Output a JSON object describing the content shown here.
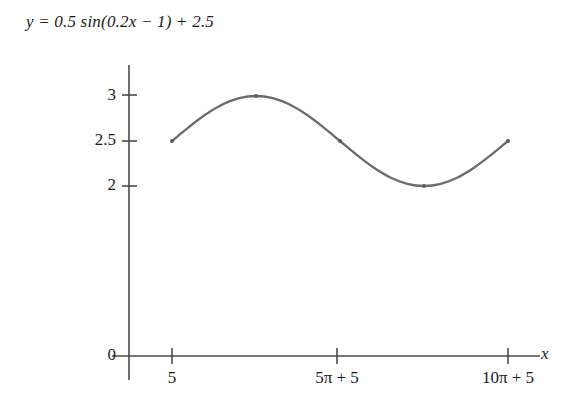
{
  "title": "y = 0.5 sin(0.2x − 1) + 2.5",
  "colors": {
    "curve": "#6b6b6b",
    "axis": "#4a4a4a",
    "text": "#1a1a1a",
    "background": "#ffffff"
  },
  "axes": {
    "x_label": "x",
    "y_label": "",
    "x_tick_labels": [
      "5",
      "5π + 5",
      "10π + 5"
    ],
    "y_tick_labels": [
      "3",
      "2.5",
      "2",
      "0"
    ]
  },
  "chart_data": {
    "type": "line",
    "title": "y = 0.5 sin(0.2x − 1) + 2.5",
    "xlabel": "x",
    "ylabel": "",
    "grid": false,
    "legend": null,
    "function": "y = 0.5 sin(0.2x - 1) + 2.5",
    "amplitude": 0.5,
    "midline": 2.5,
    "period_label": "10π",
    "x_ticks": [
      {
        "label": "5",
        "value": 5
      },
      {
        "label": "5π + 5",
        "value": 20.708
      },
      {
        "label": "10π + 5",
        "value": 36.416
      }
    ],
    "y_ticks": [
      {
        "label": "3",
        "value": 3
      },
      {
        "label": "2.5",
        "value": 2.5
      },
      {
        "label": "2",
        "value": 2
      },
      {
        "label": "0",
        "value": 0
      }
    ],
    "xlim": [
      5,
      36.416
    ],
    "ylim": [
      0,
      3.3
    ],
    "key_points": [
      {
        "label": "start",
        "x": 5,
        "y": 2.5
      },
      {
        "label": "maximum",
        "x": 12.854,
        "y": 3
      },
      {
        "label": "midline-descending",
        "x": 20.708,
        "y": 2.5
      },
      {
        "label": "minimum",
        "x": 28.562,
        "y": 2
      },
      {
        "label": "end",
        "x": 36.416,
        "y": 2.5
      }
    ],
    "series": [
      {
        "name": "y = 0.5 sin(0.2x - 1) + 2.5",
        "x": [
          5,
          6.571,
          8.142,
          9.713,
          11.283,
          12.854,
          14.425,
          15.996,
          17.567,
          19.137,
          20.708,
          22.279,
          23.85,
          25.421,
          26.991,
          28.562,
          30.133,
          31.704,
          33.275,
          34.845,
          36.416
        ],
        "values": [
          2.5,
          2.654,
          2.794,
          2.905,
          2.976,
          3.0,
          2.976,
          2.905,
          2.794,
          2.654,
          2.5,
          2.346,
          2.206,
          2.095,
          2.024,
          2.0,
          2.024,
          2.095,
          2.206,
          2.346,
          2.5
        ]
      }
    ]
  }
}
